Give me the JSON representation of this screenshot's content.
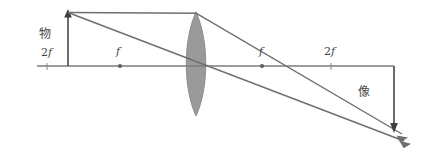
{
  "figure": {
    "kind": "optics-ray-diagram",
    "title_visible": false,
    "background_color": "#ffffff",
    "line_color": "#6b6b6b",
    "axis_color": "#7a7a7a",
    "lens_fill_color": "#9a9a9a",
    "label_color": "#444444",
    "arrow_color": "#3d3d3d"
  },
  "labels": {
    "object": "物",
    "image": "像",
    "focal_left": "f",
    "focal_right": "f",
    "double_focal_left_prefix": "2",
    "double_focal_left_suffix": "f",
    "double_focal_right_prefix": "2",
    "double_focal_right_suffix": "f"
  },
  "geometry": {
    "axis": {
      "x1": 37,
      "y": 66,
      "x2": 394
    },
    "lens": {
      "center_x": 196,
      "top_y": 12,
      "bottom_y": 116,
      "half_width": 13
    },
    "object": {
      "base_x": 68,
      "base_y": 66,
      "tip_x": 68,
      "tip_y": 12
    },
    "image": {
      "base_x": 394,
      "base_y": 66,
      "tip_x": 394,
      "tip_y": 130
    },
    "points": [
      {
        "name": "2f-left",
        "x": 47,
        "y": 66,
        "marker": "tick"
      },
      {
        "name": "f-left",
        "x": 120,
        "y": 66,
        "marker": "dot"
      },
      {
        "name": "f-right",
        "x": 262,
        "y": 66,
        "marker": "dot"
      },
      {
        "name": "2f-right",
        "x": 331,
        "y": 66,
        "marker": "tick"
      }
    ],
    "rays": [
      {
        "name": "parallel-ray-incident",
        "points": [
          [
            68,
            12
          ],
          [
            196,
            13
          ]
        ]
      },
      {
        "name": "parallel-ray-refracted",
        "points": [
          [
            196,
            13
          ],
          [
            400,
            133
          ]
        ]
      },
      {
        "name": "center-ray",
        "points": [
          [
            68,
            12
          ],
          [
            404,
            140
          ]
        ]
      }
    ]
  },
  "label_positions": {
    "object": {
      "x": 39,
      "y": 28
    },
    "image": {
      "x": 358,
      "y": 88
    },
    "f_left": {
      "x": 116,
      "y": 48
    },
    "f_right": {
      "x": 259,
      "y": 48
    },
    "tf_left": {
      "x": 41,
      "y": 49
    },
    "tf_right": {
      "x": 324,
      "y": 48
    }
  }
}
